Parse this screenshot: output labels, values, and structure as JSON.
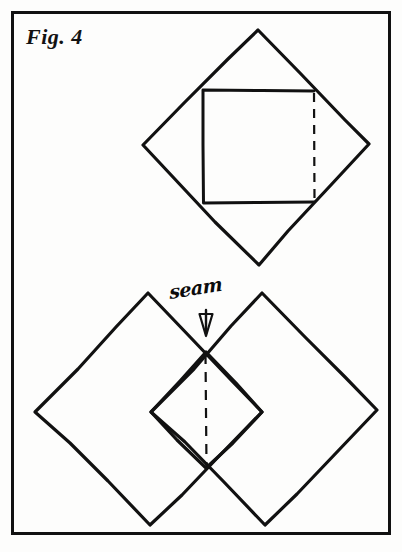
{
  "figure": {
    "label": "Fig. 4",
    "annotation": "seam",
    "background_color": "#fdfdfc",
    "ink_color": "#111111",
    "frame": {
      "x": 11,
      "y": 11,
      "width": 379,
      "height": 523,
      "stroke_width": 3
    }
  },
  "diagram": {
    "type": "line-drawing",
    "title": "Fig. 4",
    "shapes": [
      {
        "name": "upper-diamond",
        "kind": "diamond",
        "points": "258,30 369,144 259,265 143,145"
      },
      {
        "name": "upper-inner-square",
        "kind": "square",
        "solid_points": "314,91 203,90 203,203 314,202",
        "dashed_edge": "314,92 314,201"
      },
      {
        "name": "lower-left-diamond",
        "kind": "diamond",
        "points": "148,293 262,412 150,525 35,412"
      },
      {
        "name": "lower-right-diamond",
        "kind": "diamond",
        "points": "262,293 377,410 265,525 151,412"
      },
      {
        "name": "lower-center-diamond",
        "kind": "diamond",
        "points": "206,352 262,412 206,468 151,412"
      },
      {
        "name": "seam-dashed-line",
        "kind": "dashed-line",
        "points": "206,354 206,466"
      },
      {
        "name": "seam-arrow",
        "kind": "arrow-down",
        "points": "206,310 206,336"
      }
    ]
  }
}
